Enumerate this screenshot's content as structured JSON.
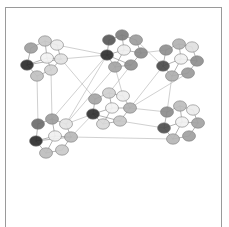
{
  "figure": {
    "title": "Hierarchical clustered network graph",
    "background_color": "#ffffff",
    "frame_color": "#9a9a9a",
    "frame": {
      "x": 5,
      "y": 7,
      "width": 217,
      "height": 220,
      "bottom_open": true
    },
    "canvas": {
      "width": 229,
      "height": 227
    }
  },
  "chart_data": {
    "type": "scatter",
    "title": "Hierarchical clustered network graph",
    "subtitle": "",
    "xlabel": "",
    "ylabel": "",
    "xlim": [
      0,
      229
    ],
    "ylim": [
      0,
      227
    ],
    "grid": false,
    "legend_position": "none",
    "tick_labels": {
      "x": [],
      "y": []
    },
    "annotations": [],
    "node_style": {
      "shape": "ellipse",
      "radius_x": 6.5,
      "radius_y": 5.2,
      "outline_color": "#7d7d7d",
      "outline_width": 0.6,
      "opacity": 0.92
    },
    "intra_cluster_edge_style": {
      "color": "#8d8d8d",
      "width": 0.8,
      "opacity": 0.85
    },
    "inter_cluster_edge_style": {
      "color": "#b4b4b4",
      "width": 0.7,
      "opacity": 0.9
    },
    "palette": {
      "darkest": "#2b2b2b",
      "dark": "#616161",
      "mid_dark": "#848484",
      "mid": "#a0a0a0",
      "mid_light": "#bcbcbc",
      "light": "#d6d6d6",
      "lightest": "#efefef"
    },
    "clusters": [
      {
        "id": "cluster-top-left",
        "label": "C1",
        "center": [
          48,
          62
        ],
        "nodes": [
          {
            "id": "c1n0",
            "x": 27,
            "y": 65,
            "color": "#2b2b2b"
          },
          {
            "id": "c1n1",
            "x": 31,
            "y": 48,
            "color": "#9e9e9e"
          },
          {
            "id": "c1n2",
            "x": 45,
            "y": 41,
            "color": "#c8c8c8"
          },
          {
            "id": "c1n3",
            "x": 57,
            "y": 45,
            "color": "#ececec"
          },
          {
            "id": "c1n4",
            "x": 61,
            "y": 59,
            "color": "#e2e2e2"
          },
          {
            "id": "c1n5",
            "x": 51,
            "y": 70,
            "color": "#d2d2d2"
          },
          {
            "id": "c1n6",
            "x": 37,
            "y": 76,
            "color": "#c0c0c0"
          },
          {
            "id": "c1n7",
            "x": 47,
            "y": 58,
            "color": "#f2f2f2"
          }
        ],
        "edges": [
          [
            "c1n0",
            "c1n1"
          ],
          [
            "c1n0",
            "c1n7"
          ],
          [
            "c1n0",
            "c1n6"
          ],
          [
            "c1n1",
            "c1n2"
          ],
          [
            "c1n2",
            "c1n3"
          ],
          [
            "c1n3",
            "c1n4"
          ],
          [
            "c1n4",
            "c1n5"
          ],
          [
            "c1n5",
            "c1n6"
          ],
          [
            "c1n7",
            "c1n2"
          ],
          [
            "c1n7",
            "c1n4"
          ],
          [
            "c1n7",
            "c1n5"
          ],
          [
            "c1n0",
            "c1n4"
          ]
        ]
      },
      {
        "id": "cluster-top-middle",
        "label": "C2",
        "center": [
          122,
          53
        ],
        "nodes": [
          {
            "id": "c2n0",
            "x": 107,
            "y": 55,
            "color": "#2f2f2f"
          },
          {
            "id": "c2n1",
            "x": 109,
            "y": 40,
            "color": "#585858"
          },
          {
            "id": "c2n2",
            "x": 122,
            "y": 35,
            "color": "#7e7e7e"
          },
          {
            "id": "c2n3",
            "x": 136,
            "y": 40,
            "color": "#9c9c9c"
          },
          {
            "id": "c2n4",
            "x": 141,
            "y": 53,
            "color": "#8a8a8a"
          },
          {
            "id": "c2n5",
            "x": 131,
            "y": 65,
            "color": "#8f8f8f"
          },
          {
            "id": "c2n6",
            "x": 115,
            "y": 67,
            "color": "#a4a4a4"
          },
          {
            "id": "c2n7",
            "x": 124,
            "y": 50,
            "color": "#efefef"
          }
        ],
        "edges": [
          [
            "c2n0",
            "c2n1"
          ],
          [
            "c2n1",
            "c2n2"
          ],
          [
            "c2n2",
            "c2n3"
          ],
          [
            "c2n3",
            "c2n4"
          ],
          [
            "c2n4",
            "c2n5"
          ],
          [
            "c2n5",
            "c2n6"
          ],
          [
            "c2n6",
            "c2n0"
          ],
          [
            "c2n7",
            "c2n0"
          ],
          [
            "c2n7",
            "c2n2"
          ],
          [
            "c2n7",
            "c2n4"
          ],
          [
            "c2n7",
            "c2n6"
          ],
          [
            "c2n0",
            "c2n5"
          ]
        ]
      },
      {
        "id": "cluster-top-right",
        "label": "C3",
        "center": [
          182,
          62
        ],
        "nodes": [
          {
            "id": "c3n0",
            "x": 163,
            "y": 66,
            "color": "#4a4a4a"
          },
          {
            "id": "c3n1",
            "x": 166,
            "y": 50,
            "color": "#8f8f8f"
          },
          {
            "id": "c3n2",
            "x": 179,
            "y": 44,
            "color": "#b2b2b2"
          },
          {
            "id": "c3n3",
            "x": 192,
            "y": 47,
            "color": "#e0e0e0"
          },
          {
            "id": "c3n4",
            "x": 197,
            "y": 61,
            "color": "#8e8e8e"
          },
          {
            "id": "c3n5",
            "x": 188,
            "y": 73,
            "color": "#9a9a9a"
          },
          {
            "id": "c3n6",
            "x": 172,
            "y": 76,
            "color": "#aeaeae"
          },
          {
            "id": "c3n7",
            "x": 181,
            "y": 59,
            "color": "#f0f0f0"
          }
        ],
        "edges": [
          [
            "c3n0",
            "c3n1"
          ],
          [
            "c3n1",
            "c3n2"
          ],
          [
            "c3n2",
            "c3n3"
          ],
          [
            "c3n3",
            "c3n4"
          ],
          [
            "c3n4",
            "c3n5"
          ],
          [
            "c3n5",
            "c3n6"
          ],
          [
            "c3n6",
            "c3n0"
          ],
          [
            "c3n7",
            "c3n0"
          ],
          [
            "c3n7",
            "c3n2"
          ],
          [
            "c3n7",
            "c3n4"
          ],
          [
            "c3n7",
            "c3n6"
          ]
        ]
      },
      {
        "id": "cluster-center",
        "label": "C4",
        "center": [
          113,
          112
        ],
        "nodes": [
          {
            "id": "c4n0",
            "x": 93,
            "y": 114,
            "color": "#303030"
          },
          {
            "id": "c4n1",
            "x": 95,
            "y": 99,
            "color": "#a5a5a5"
          },
          {
            "id": "c4n2",
            "x": 109,
            "y": 93,
            "color": "#cfcfcf"
          },
          {
            "id": "c4n3",
            "x": 123,
            "y": 96,
            "color": "#ededed"
          },
          {
            "id": "c4n4",
            "x": 130,
            "y": 108,
            "color": "#b0b0b0"
          },
          {
            "id": "c4n5",
            "x": 120,
            "y": 121,
            "color": "#c7c7c7"
          },
          {
            "id": "c4n6",
            "x": 103,
            "y": 124,
            "color": "#d8d8d8"
          },
          {
            "id": "c4n7",
            "x": 112,
            "y": 108,
            "color": "#f2f2f2"
          }
        ],
        "edges": [
          [
            "c4n0",
            "c4n1"
          ],
          [
            "c4n1",
            "c4n2"
          ],
          [
            "c4n2",
            "c4n3"
          ],
          [
            "c4n3",
            "c4n4"
          ],
          [
            "c4n4",
            "c4n5"
          ],
          [
            "c4n5",
            "c4n6"
          ],
          [
            "c4n6",
            "c4n0"
          ],
          [
            "c4n7",
            "c4n0"
          ],
          [
            "c4n7",
            "c4n2"
          ],
          [
            "c4n7",
            "c4n4"
          ],
          [
            "c4n7",
            "c4n6"
          ],
          [
            "c4n0",
            "c4n5"
          ]
        ]
      },
      {
        "id": "cluster-bottom-left",
        "label": "C5",
        "center": [
          57,
          137
        ],
        "nodes": [
          {
            "id": "c5n0",
            "x": 36,
            "y": 141,
            "color": "#2d2d2d"
          },
          {
            "id": "c5n1",
            "x": 38,
            "y": 124,
            "color": "#6b6b6b"
          },
          {
            "id": "c5n2",
            "x": 52,
            "y": 119,
            "color": "#9d9d9d"
          },
          {
            "id": "c5n3",
            "x": 66,
            "y": 124,
            "color": "#e4e4e4"
          },
          {
            "id": "c5n4",
            "x": 71,
            "y": 137,
            "color": "#b9b9b9"
          },
          {
            "id": "c5n5",
            "x": 62,
            "y": 150,
            "color": "#cacaca"
          },
          {
            "id": "c5n6",
            "x": 46,
            "y": 153,
            "color": "#bdbdbd"
          },
          {
            "id": "c5n7",
            "x": 55,
            "y": 136,
            "color": "#f0f0f0"
          }
        ],
        "edges": [
          [
            "c5n0",
            "c5n1"
          ],
          [
            "c5n1",
            "c5n2"
          ],
          [
            "c5n2",
            "c5n3"
          ],
          [
            "c5n3",
            "c5n4"
          ],
          [
            "c5n4",
            "c5n5"
          ],
          [
            "c5n5",
            "c5n6"
          ],
          [
            "c5n6",
            "c5n0"
          ],
          [
            "c5n7",
            "c5n0"
          ],
          [
            "c5n7",
            "c5n2"
          ],
          [
            "c5n7",
            "c5n4"
          ],
          [
            "c5n7",
            "c5n6"
          ],
          [
            "c5n0",
            "c5n4"
          ]
        ]
      },
      {
        "id": "cluster-bottom-right",
        "label": "C6",
        "center": [
          183,
          125
        ],
        "nodes": [
          {
            "id": "c6n0",
            "x": 164,
            "y": 128,
            "color": "#4e4e4e"
          },
          {
            "id": "c6n1",
            "x": 167,
            "y": 112,
            "color": "#8c8c8c"
          },
          {
            "id": "c6n2",
            "x": 180,
            "y": 106,
            "color": "#bdbdbd"
          },
          {
            "id": "c6n3",
            "x": 193,
            "y": 110,
            "color": "#ececec"
          },
          {
            "id": "c6n4",
            "x": 198,
            "y": 123,
            "color": "#a3a3a3"
          },
          {
            "id": "c6n5",
            "x": 189,
            "y": 136,
            "color": "#9f9f9f"
          },
          {
            "id": "c6n6",
            "x": 173,
            "y": 139,
            "color": "#b6b6b6"
          },
          {
            "id": "c6n7",
            "x": 182,
            "y": 122,
            "color": "#f1f1f1"
          }
        ],
        "edges": [
          [
            "c6n0",
            "c6n1"
          ],
          [
            "c6n1",
            "c6n2"
          ],
          [
            "c6n2",
            "c6n3"
          ],
          [
            "c6n3",
            "c6n4"
          ],
          [
            "c6n4",
            "c6n5"
          ],
          [
            "c6n5",
            "c6n6"
          ],
          [
            "c6n6",
            "c6n0"
          ],
          [
            "c6n7",
            "c6n0"
          ],
          [
            "c6n7",
            "c6n2"
          ],
          [
            "c6n7",
            "c6n4"
          ],
          [
            "c6n7",
            "c6n6"
          ]
        ]
      }
    ],
    "inter_cluster_edges": [
      [
        "c1n4",
        "c2n0"
      ],
      [
        "c1n5",
        "c5n2"
      ],
      [
        "c1n6",
        "c5n1"
      ],
      [
        "c2n0",
        "c5n3"
      ],
      [
        "c2n0",
        "c1n3"
      ],
      [
        "c2n5",
        "c4n2"
      ],
      [
        "c2n4",
        "c3n1"
      ],
      [
        "c2n6",
        "c4n3"
      ],
      [
        "c3n0",
        "c2n3"
      ],
      [
        "c3n6",
        "c6n1"
      ],
      [
        "c3n0",
        "c4n4"
      ],
      [
        "c4n0",
        "c5n4"
      ],
      [
        "c4n5",
        "c6n0"
      ],
      [
        "c4n4",
        "c6n1"
      ],
      [
        "c5n3",
        "c4n0"
      ],
      [
        "c5n4",
        "c6n6"
      ],
      [
        "c1n4",
        "c4n1"
      ],
      [
        "c2n6",
        "c5n3"
      ],
      [
        "c3n5",
        "c4n4"
      ],
      [
        "c5n2",
        "c2n0"
      ]
    ]
  }
}
